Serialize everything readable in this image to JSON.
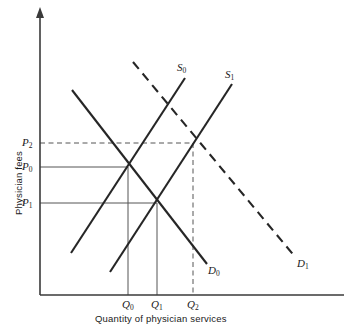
{
  "figure": {
    "kind": "supply-demand-diagram",
    "background_color": "#ffffff",
    "line_color": "#262626",
    "helper_line_color": "#555555"
  },
  "axes": {
    "y_title": "Physician fees",
    "x_title": "Quantity of physician services",
    "origin": {
      "x": 40,
      "y": 295
    },
    "x_axis_end": {
      "x": 344,
      "y": 295
    },
    "y_axis_top": {
      "x": 40,
      "y": 8
    },
    "y_arrow": true
  },
  "price_ticks": [
    {
      "id": "P2",
      "label": "P",
      "sub": "2",
      "y": 143,
      "label_x": 22,
      "label_y": 137
    },
    {
      "id": "P0",
      "label": "P",
      "sub": "0",
      "y": 167,
      "label_x": 22,
      "label_y": 161
    },
    {
      "id": "P1",
      "label": "P",
      "sub": "1",
      "y": 203,
      "label_x": 22,
      "label_y": 197
    }
  ],
  "quantity_ticks": [
    {
      "id": "Q0",
      "label": "Q",
      "sub": "0",
      "x": 128,
      "label_x": 122,
      "label_y": 299
    },
    {
      "id": "Q1",
      "label": "Q",
      "sub": "1",
      "x": 157,
      "label_x": 151,
      "label_y": 299
    },
    {
      "id": "Q2",
      "label": "Q",
      "sub": "2",
      "x": 193,
      "label_x": 187,
      "label_y": 299
    }
  ],
  "curves": [
    {
      "id": "S0",
      "label": "S",
      "sub": "0",
      "type": "supply",
      "style": "solid",
      "from": {
        "x": 71,
        "y": 253
      },
      "to": {
        "x": 185,
        "y": 78
      },
      "label_x": 177,
      "label_y": 62
    },
    {
      "id": "S1",
      "label": "S",
      "sub": "1",
      "type": "supply",
      "style": "solid",
      "from": {
        "x": 110,
        "y": 272
      },
      "to": {
        "x": 232,
        "y": 84
      },
      "label_x": 225,
      "label_y": 69
    },
    {
      "id": "D0",
      "label": "D",
      "sub": "0",
      "type": "demand",
      "style": "solid",
      "from": {
        "x": 72,
        "y": 90
      },
      "to": {
        "x": 207,
        "y": 264
      },
      "label_x": 208,
      "label_y": 265
    },
    {
      "id": "D1",
      "label": "D",
      "sub": "1",
      "type": "demand",
      "style": "dashed",
      "from": {
        "x": 133,
        "y": 62
      },
      "to": {
        "x": 296,
        "y": 258
      },
      "label_x": 297,
      "label_y": 258
    }
  ],
  "equilibria": [
    {
      "id": "E0",
      "x": 128,
      "y": 167,
      "price": "P0",
      "quantity": "Q0",
      "curves": "S0 x D0"
    },
    {
      "id": "E1",
      "x": 157,
      "y": 203,
      "price": "P1",
      "quantity": "Q1",
      "curves": "S1 x D0"
    },
    {
      "id": "E2",
      "x": 193,
      "y": 143,
      "price": "P2",
      "quantity": "Q2",
      "curves": "S1 x D1"
    }
  ],
  "guide_lines": [
    {
      "id": "P0-horizontal",
      "style": "solid",
      "x1": 40,
      "y1": 167,
      "x2": 128,
      "y2": 167
    },
    {
      "id": "P1-horizontal",
      "style": "solid",
      "x1": 40,
      "y1": 203,
      "x2": 157,
      "y2": 203
    },
    {
      "id": "P2-horizontal",
      "style": "dashed",
      "x1": 40,
      "y1": 143,
      "x2": 193,
      "y2": 143
    },
    {
      "id": "Q0-vertical",
      "style": "solid",
      "x1": 128,
      "y1": 167,
      "x2": 128,
      "y2": 295
    },
    {
      "id": "Q1-vertical",
      "style": "solid",
      "x1": 157,
      "y1": 203,
      "x2": 157,
      "y2": 295
    },
    {
      "id": "Q2-vertical",
      "style": "dashed",
      "x1": 193,
      "y1": 143,
      "x2": 193,
      "y2": 295
    }
  ]
}
